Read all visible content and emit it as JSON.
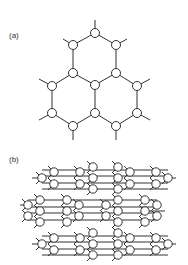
{
  "figure": {
    "panel_a": {
      "label": "(a)",
      "description": "Hexagonal network of three fused rings with circular nodes",
      "nodes": [
        [
          95,
          33
        ],
        [
          73,
          45
        ],
        [
          116,
          45
        ],
        [
          73,
          73
        ],
        [
          116,
          73
        ],
        [
          95,
          85
        ],
        [
          52,
          86
        ],
        [
          137,
          86
        ],
        [
          52,
          113
        ],
        [
          95,
          113
        ],
        [
          137,
          113
        ],
        [
          73,
          126
        ],
        [
          116,
          126
        ]
      ],
      "bonds": [
        [
          0,
          1
        ],
        [
          0,
          2
        ],
        [
          1,
          3
        ],
        [
          2,
          4
        ],
        [
          3,
          5
        ],
        [
          4,
          5
        ],
        [
          3,
          6
        ],
        [
          4,
          7
        ],
        [
          6,
          8
        ],
        [
          7,
          10
        ],
        [
          5,
          9
        ],
        [
          8,
          11
        ],
        [
          9,
          11
        ],
        [
          9,
          12
        ],
        [
          10,
          12
        ]
      ],
      "stubs": [
        [
          95,
          33,
          95,
          20
        ],
        [
          73,
          45,
          63,
          39
        ],
        [
          116,
          45,
          127,
          39
        ],
        [
          52,
          86,
          39,
          79
        ],
        [
          137,
          86,
          150,
          79
        ],
        [
          52,
          113,
          39,
          120
        ],
        [
          137,
          113,
          150,
          120
        ],
        [
          73,
          126,
          73,
          140
        ],
        [
          116,
          126,
          116,
          140
        ]
      ]
    },
    "panel_b": {
      "label": "(b)",
      "description": "Layered network of stacked circular-node clusters connected by horizontal bonds",
      "rows": [
        {
          "bonds_y": [
            170,
            176,
            183,
            189
          ],
          "clusters": [
            {
              "circles": [
                [
                  42,
                  178
                ],
                [
                  54,
                  172
                ],
                [
                  54,
                  184
                ]
              ],
              "stub": [
                32,
                178
              ]
            },
            {
              "circles": [
                [
                  80,
                  172
                ],
                [
                  80,
                  184
                ],
                [
                  93,
                  167
                ],
                [
                  93,
                  178
                ],
                [
                  93,
                  189
                ]
              ]
            },
            {
              "circles": [
                [
                  118,
                  167
                ],
                [
                  118,
                  178
                ],
                [
                  118,
                  189
                ],
                [
                  130,
                  172
                ],
                [
                  130,
                  184
                ]
              ]
            },
            {
              "circles": [
                [
                  156,
                  172
                ],
                [
                  156,
                  184
                ],
                [
                  168,
                  178
                ]
              ],
              "stub": [
                176,
                178
              ]
            }
          ]
        },
        {
          "bonds_y": [
            200,
            207,
            213,
            220
          ],
          "clusters": [
            {
              "circles": [
                [
                  28,
                  205
                ],
                [
                  28,
                  216
                ],
                [
                  40,
                  200
                ],
                [
                  40,
                  211
                ],
                [
                  40,
                  222
                ]
              ],
              "stub": [
                20,
                205
              ]
            },
            {
              "circles": [
                [
                  67,
                  200
                ],
                [
                  67,
                  211
                ],
                [
                  67,
                  222
                ],
                [
                  79,
                  205
                ],
                [
                  79,
                  216
                ]
              ]
            },
            {
              "circles": [
                [
                  106,
                  205
                ],
                [
                  106,
                  216
                ],
                [
                  118,
                  200
                ],
                [
                  118,
                  211
                ],
                [
                  118,
                  222
                ]
              ]
            },
            {
              "circles": [
                [
                  145,
                  200
                ],
                [
                  145,
                  211
                ],
                [
                  145,
                  222
                ],
                [
                  157,
                  205
                ],
                [
                  157,
                  216
                ]
              ],
              "stub": [
                165,
                211
              ]
            }
          ]
        },
        {
          "bonds_y": [
            236,
            242,
            249,
            255
          ],
          "clusters": [
            {
              "circles": [
                [
                  42,
                  244
                ],
                [
                  54,
                  238
                ],
                [
                  54,
                  250
                ]
              ],
              "stub": [
                32,
                244
              ]
            },
            {
              "circles": [
                [
                  80,
                  238
                ],
                [
                  80,
                  250
                ],
                [
                  93,
                  233
                ],
                [
                  93,
                  244
                ],
                [
                  93,
                  255
                ]
              ]
            },
            {
              "circles": [
                [
                  118,
                  233
                ],
                [
                  118,
                  244
                ],
                [
                  118,
                  255
                ],
                [
                  130,
                  238
                ],
                [
                  130,
                  250
                ]
              ]
            },
            {
              "circles": [
                [
                  156,
                  238
                ],
                [
                  156,
                  250
                ],
                [
                  168,
                  244
                ]
              ],
              "stub": [
                176,
                244
              ]
            }
          ]
        }
      ]
    }
  }
}
